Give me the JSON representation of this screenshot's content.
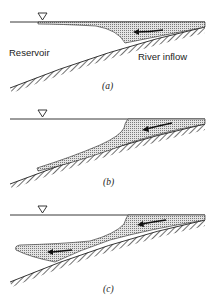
{
  "figure": {
    "panels": [
      {
        "id": "a",
        "caption": "(a)",
        "labels": {
          "left": "Reservoir",
          "right": "River inflow"
        },
        "flow": "overflow"
      },
      {
        "id": "b",
        "caption": "(b)",
        "flow": "underflow"
      },
      {
        "id": "c",
        "caption": "(c)",
        "flow": "interflow"
      }
    ],
    "symbols": {
      "water_surface": "inverted-triangle"
    },
    "colors": {
      "line": "#222222",
      "stipple": "#9a9a9a",
      "background": "#ffffff"
    }
  }
}
